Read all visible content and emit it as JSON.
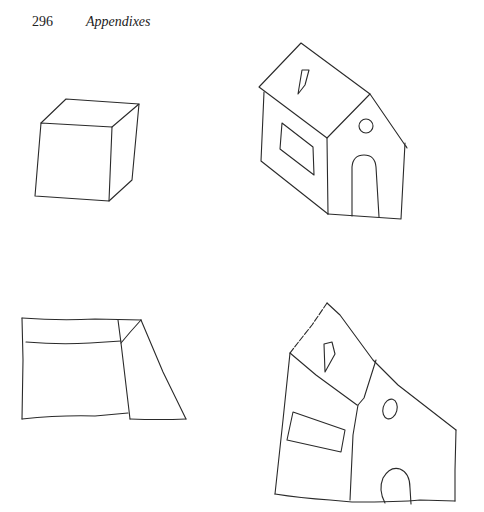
{
  "header": {
    "page_number": "296",
    "running_head": "Appendixes"
  },
  "figures": [
    {
      "id": "model-cube",
      "description": "Reference drawing of a cube in perspective"
    },
    {
      "id": "model-house",
      "description": "Reference drawing of a house with window, roof skylight, round window and arched door"
    },
    {
      "id": "copy-cube",
      "description": "Hand-drawn copy of the cube"
    },
    {
      "id": "copy-house",
      "description": "Hand-drawn copy of the house"
    }
  ],
  "colors": {
    "background": "#ffffff",
    "ink": "#2a2a2a"
  }
}
